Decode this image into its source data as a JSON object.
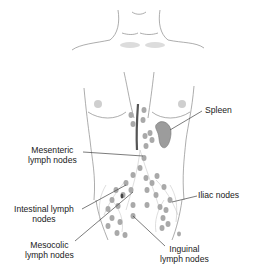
{
  "diagram": {
    "type": "anatomical-illustration",
    "colors": {
      "outline": "#8a8a8a",
      "node_fill": "#a9a9a9",
      "spleen_fill": "#9c9c9c",
      "leader_line": "#444444",
      "text": "#1a1a1a",
      "vessel": "#555555"
    },
    "labels": [
      {
        "id": "spleen",
        "lines": [
          "Spleen"
        ]
      },
      {
        "id": "mesenteric",
        "lines": [
          "Mesenteric",
          "lymph nodes"
        ]
      },
      {
        "id": "intestinal",
        "lines": [
          "Intestinal lymph",
          "nodes"
        ]
      },
      {
        "id": "iliac",
        "lines": [
          "Iliac nodes"
        ]
      },
      {
        "id": "mesocolic",
        "lines": [
          "Mesocolic",
          "lymph nodes"
        ]
      },
      {
        "id": "inguinal",
        "lines": [
          "Inguinal",
          "lymph nodes"
        ]
      }
    ]
  }
}
